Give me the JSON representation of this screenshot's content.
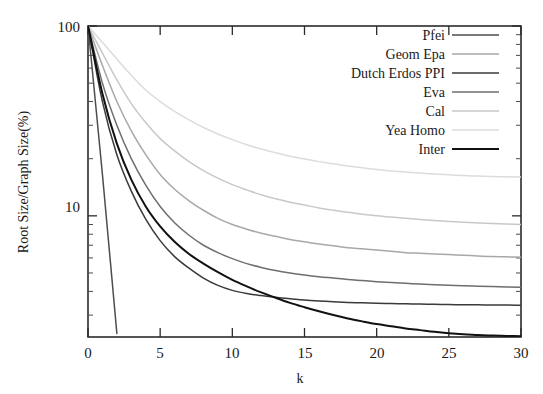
{
  "chart_data": {
    "type": "line",
    "title": "",
    "xlabel": "k",
    "ylabel": "Root Size/Graph Size(%)",
    "xlim": [
      0,
      30
    ],
    "ylim": [
      2.3,
      100
    ],
    "yscale": "log",
    "xscale": "linear",
    "grid": false,
    "xticks": [
      0,
      5,
      10,
      15,
      20,
      25,
      30
    ],
    "xtick_labels": [
      "0",
      "5",
      "10",
      "15",
      "20",
      "25",
      "30"
    ],
    "yticks": [
      10,
      100
    ],
    "ytick_labels": [
      "10",
      "100"
    ],
    "legend_position": "top-right",
    "x": [
      0,
      1,
      2,
      3,
      4,
      5,
      6,
      7,
      8,
      9,
      10,
      11,
      12,
      13,
      14,
      15,
      16,
      17,
      18,
      19,
      20,
      21,
      22,
      23,
      24,
      25,
      26,
      27,
      28,
      29,
      30
    ],
    "series": [
      {
        "name": "Pfei",
        "color": "#4d4d4d",
        "values": [
          100,
          16.5,
          2.4,
          null,
          null,
          null,
          null,
          null,
          null,
          null,
          null,
          null,
          null,
          null,
          null,
          null,
          null,
          null,
          null,
          null,
          null,
          null,
          null,
          null,
          null,
          null,
          null,
          null,
          null,
          null,
          null
        ]
      },
      {
        "name": "Geom Epa",
        "color": "#a8a8a8",
        "values": [
          100,
          62,
          40,
          28,
          21,
          16.5,
          13.8,
          12.0,
          10.7,
          9.7,
          9.0,
          8.5,
          8.1,
          7.8,
          7.5,
          7.3,
          7.1,
          6.95,
          6.8,
          6.7,
          6.6,
          6.5,
          6.4,
          6.35,
          6.3,
          6.25,
          6.2,
          6.15,
          6.1,
          6.08,
          6.05
        ]
      },
      {
        "name": "Dutch Erdos PPI",
        "color": "#3a3a3a",
        "values": [
          100,
          40,
          21,
          13.5,
          9.6,
          7.4,
          6.1,
          5.3,
          4.7,
          4.3,
          4.05,
          3.9,
          3.8,
          3.72,
          3.66,
          3.6,
          3.56,
          3.53,
          3.5,
          3.48,
          3.46,
          3.45,
          3.44,
          3.43,
          3.42,
          3.41,
          3.4,
          3.4,
          3.39,
          3.39,
          3.38
        ]
      },
      {
        "name": "Eva",
        "color": "#6e6e6e",
        "values": [
          100,
          50,
          30,
          20,
          14.5,
          11.2,
          9.2,
          7.9,
          7.0,
          6.4,
          5.95,
          5.6,
          5.35,
          5.15,
          5.0,
          4.88,
          4.78,
          4.7,
          4.62,
          4.56,
          4.5,
          4.45,
          4.41,
          4.37,
          4.34,
          4.31,
          4.28,
          4.26,
          4.24,
          4.22,
          4.2
        ]
      },
      {
        "name": "Cal",
        "color": "#c8c8c8",
        "values": [
          100,
          72,
          52,
          39,
          31,
          25.5,
          22,
          19.3,
          17.3,
          15.8,
          14.6,
          13.7,
          12.9,
          12.3,
          11.8,
          11.4,
          11.0,
          10.7,
          10.45,
          10.2,
          10.0,
          9.85,
          9.7,
          9.57,
          9.45,
          9.35,
          9.25,
          9.17,
          9.1,
          9.05,
          9.0
        ]
      },
      {
        "name": "Yea Homo",
        "color": "#dcdcdc",
        "values": [
          100,
          82,
          67,
          55,
          46,
          40,
          35.5,
          32,
          29.2,
          27,
          25.2,
          23.7,
          22.5,
          21.5,
          20.6,
          19.9,
          19.3,
          18.8,
          18.3,
          17.9,
          17.55,
          17.25,
          17.0,
          16.8,
          16.6,
          16.45,
          16.3,
          16.2,
          16.1,
          16.05,
          16.0
        ]
      },
      {
        "name": "Inter",
        "color": "#111111",
        "values": [
          100,
          44,
          24,
          15.5,
          11.2,
          8.8,
          7.3,
          6.3,
          5.6,
          5.05,
          4.6,
          4.25,
          3.95,
          3.7,
          3.48,
          3.3,
          3.14,
          3.0,
          2.88,
          2.78,
          2.69,
          2.62,
          2.55,
          2.5,
          2.45,
          2.41,
          2.38,
          2.36,
          2.34,
          2.33,
          2.32
        ]
      }
    ]
  },
  "axes": {
    "ylabel": "Root Size/Graph Size(%)",
    "xlabel": "k",
    "ytick_100": "100",
    "ytick_10": "10",
    "xtick_0": "0",
    "xtick_5": "5",
    "xtick_10": "10",
    "xtick_15": "15",
    "xtick_20": "20",
    "xtick_25": "25",
    "xtick_30": "30"
  },
  "legend": {
    "items": [
      {
        "label": "Pfei"
      },
      {
        "label": "Geom Epa"
      },
      {
        "label": "Dutch Erdos PPI"
      },
      {
        "label": "Eva"
      },
      {
        "label": "Cal"
      },
      {
        "label": "Yea Homo"
      },
      {
        "label": "Inter"
      }
    ]
  }
}
